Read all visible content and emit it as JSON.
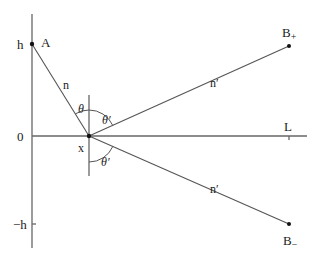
{
  "diagram": {
    "type": "reflection-geometry",
    "axes": {
      "vertical_labels": {
        "top": "h",
        "middle": "0",
        "bottom": "−h"
      },
      "horizontal_end_label": "L"
    },
    "points": {
      "A": {
        "label": "A",
        "x": 32,
        "y": 44
      },
      "X": {
        "label": "x",
        "x": 89,
        "y": 136
      },
      "B_plus": {
        "label": "B",
        "sub": "+",
        "x": 289,
        "y": 46
      },
      "B_minus": {
        "label": "B",
        "sub": "−",
        "x": 289,
        "y": 224
      }
    },
    "segments": [
      {
        "from": "A",
        "to": "X",
        "label": "n"
      },
      {
        "from": "X",
        "to": "B_plus",
        "label": "n′"
      },
      {
        "from": "X",
        "to": "B_minus",
        "label": "n′"
      }
    ],
    "angles": {
      "incident": "θ",
      "reflected_upper": "θ′",
      "reflected_lower": "θ′"
    },
    "colors": {
      "line": "#555555",
      "axis": "#666666",
      "text": "#222222"
    }
  }
}
